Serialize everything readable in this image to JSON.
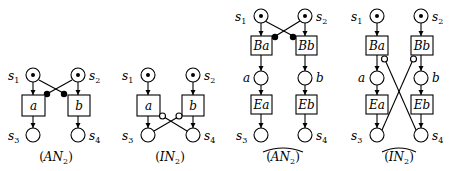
{
  "diagrams": [
    {
      "id": "AN2",
      "caption": {
        "open": "(",
        "main": "AN",
        "sub": "2",
        "close": ")",
        "hat": false
      },
      "places": {
        "s1": "s",
        "s1_sub": "1",
        "s2": "s",
        "s2_sub": "2",
        "s3": "s",
        "s3_sub": "3",
        "s4": "s",
        "s4_sub": "4"
      },
      "transitions": {
        "left": "a",
        "right": "b"
      },
      "inhibitor_style": "filled"
    },
    {
      "id": "IN2",
      "caption": {
        "open": "(",
        "main": "IN",
        "sub": "2",
        "close": ")",
        "hat": false
      },
      "places": {
        "s1": "s",
        "s1_sub": "1",
        "s2": "s",
        "s2_sub": "2",
        "s3": "s",
        "s3_sub": "3",
        "s4": "s",
        "s4_sub": "4"
      },
      "transitions": {
        "left": "a",
        "right": "b"
      },
      "inhibitor_style": "hollow"
    },
    {
      "id": "AN2_hat",
      "caption": {
        "open": "(",
        "main": "AN",
        "sub": "2",
        "close": ")",
        "hat": true
      },
      "places": {
        "s1": "s",
        "s1_sub": "1",
        "s2": "s",
        "s2_sub": "2",
        "s3": "s",
        "s3_sub": "3",
        "s4": "s",
        "s4_sub": "4",
        "mid_left": "a",
        "mid_right": "b"
      },
      "transitions": {
        "begin_left": "Ba",
        "begin_right": "Bb",
        "end_left": "Ea",
        "end_right": "Eb"
      },
      "inhibitor_style": "filled"
    },
    {
      "id": "IN2_hat",
      "caption": {
        "open": "(",
        "main": "IN",
        "sub": "2",
        "close": ")",
        "hat": true
      },
      "places": {
        "s1": "s",
        "s1_sub": "1",
        "s2": "s",
        "s2_sub": "2",
        "s3": "s",
        "s3_sub": "3",
        "s4": "s",
        "s4_sub": "4",
        "mid_left": "a",
        "mid_right": "b"
      },
      "transitions": {
        "begin_left": "Ba",
        "begin_right": "Bb",
        "end_left": "Ea",
        "end_right": "Eb"
      },
      "inhibitor_style": "hollow"
    }
  ],
  "colors": {
    "stroke": "#000000",
    "background": "#ffffff"
  }
}
